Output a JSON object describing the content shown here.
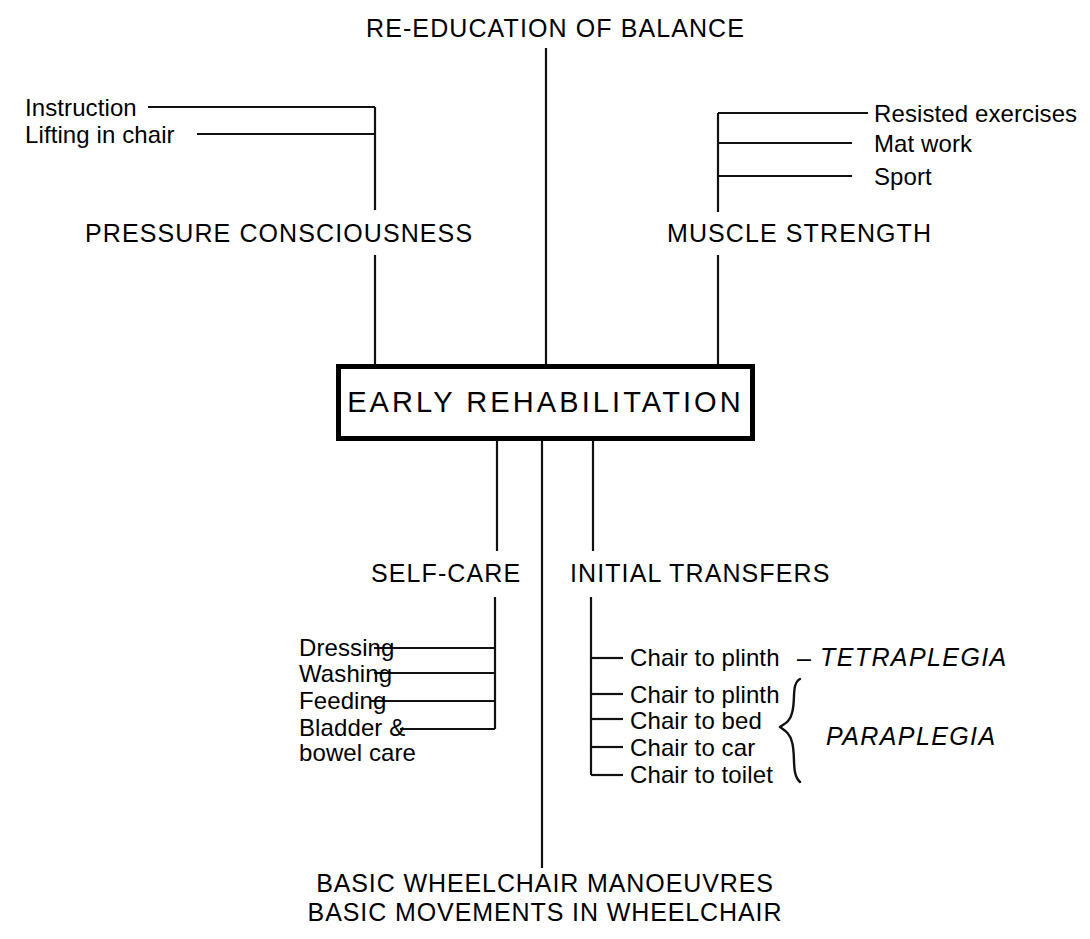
{
  "diagram": {
    "title": "RE-EDUCATION OF BALANCE",
    "center_node": "EARLY REHABILITATION",
    "branches": {
      "pressure_consciousness": {
        "heading": "PRESSURE CONSCIOUSNESS",
        "items": [
          "Instruction",
          "Lifting in chair"
        ]
      },
      "muscle_strength": {
        "heading": "MUSCLE STRENGTH",
        "items": [
          "Resisted exercises",
          "Mat work",
          "Sport"
        ]
      },
      "self_care": {
        "heading": "SELF-CARE",
        "items": [
          "Dressing",
          "Washing",
          "Feeding",
          "Bladder &",
          "bowel care"
        ]
      },
      "initial_transfers": {
        "heading": "INITIAL TRANSFERS",
        "tetraplegia": {
          "label": "TETRAPLEGIA",
          "dash": "–",
          "items": [
            "Chair to plinth"
          ]
        },
        "paraplegia": {
          "label": "PARAPLEGIA",
          "items": [
            "Chair to plinth",
            "Chair to bed",
            "Chair to car",
            "Chair to toilet"
          ]
        }
      }
    },
    "bottom": {
      "line1": "BASIC WHEELCHAIR MANOEUVRES",
      "line2": "BASIC MOVEMENTS IN WHEELCHAIR"
    }
  },
  "colors": {
    "ink": "#111111",
    "background": "#ffffff"
  }
}
